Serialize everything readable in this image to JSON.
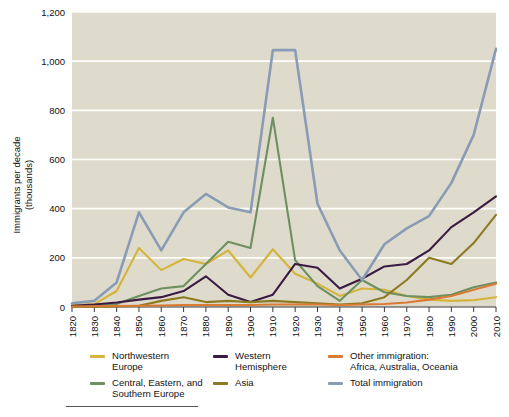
{
  "chart_data": {
    "type": "line",
    "title": "",
    "xlabel": "",
    "ylabel": "Immigrants per decade\n(thousands)",
    "ylabel_line1": "Immigrants per decade",
    "ylabel_line2": "(thousands)",
    "xlim": [
      1820,
      2010
    ],
    "ylim": [
      0,
      1200
    ],
    "yticks": [
      0,
      200,
      400,
      600,
      800,
      1000,
      1200
    ],
    "ytick_labels": [
      "0",
      "200",
      "400",
      "600",
      "800",
      "1,000",
      "1,200"
    ],
    "grid": "horizontal",
    "legend_position": "below",
    "plot_background": "#dedbcc",
    "x": [
      1820,
      1830,
      1840,
      1850,
      1860,
      1870,
      1880,
      1890,
      1900,
      1910,
      1920,
      1930,
      1940,
      1950,
      1960,
      1970,
      1980,
      1990,
      2000,
      2010
    ],
    "xtick_labels": [
      "1820",
      "1830",
      "1840",
      "1850",
      "1860",
      "1870",
      "1880",
      "1890",
      "1900",
      "1910",
      "1920",
      "1930",
      "1940",
      "1950",
      "1960",
      "1970",
      "1980",
      "1990",
      "2000",
      "2010"
    ],
    "series": [
      {
        "name": "Northwestern Europe",
        "color": "#d5b43c",
        "values": [
          8,
          12,
          65,
          240,
          150,
          195,
          175,
          230,
          120,
          235,
          135,
          95,
          45,
          75,
          70,
          45,
          30,
          25,
          28,
          40
        ]
      },
      {
        "name": "Central, Eastern, and Southern Europe",
        "color": "#6e9061",
        "values": [
          2,
          3,
          12,
          45,
          75,
          85,
          175,
          265,
          240,
          770,
          190,
          85,
          25,
          110,
          60,
          45,
          40,
          50,
          80,
          100
        ]
      },
      {
        "name": "Western Hemisphere",
        "color": "#3b1b42",
        "values": [
          5,
          10,
          18,
          30,
          40,
          65,
          125,
          50,
          20,
          50,
          175,
          160,
          75,
          115,
          165,
          175,
          230,
          325,
          385,
          450
        ]
      },
      {
        "name": "Asia",
        "color": "#8c7a22",
        "values": [
          1,
          1,
          2,
          5,
          25,
          40,
          20,
          25,
          20,
          25,
          20,
          15,
          10,
          15,
          40,
          110,
          200,
          175,
          260,
          375
        ]
      },
      {
        "name": "Other immigration: Africa, Australia, Oceania",
        "color": "#d97b34",
        "values": [
          2,
          3,
          4,
          5,
          6,
          8,
          8,
          8,
          8,
          10,
          10,
          10,
          8,
          10,
          12,
          18,
          30,
          45,
          70,
          95
        ]
      },
      {
        "name": "Total immigration",
        "color": "#8a9bb5",
        "values": [
          15,
          25,
          100,
          385,
          230,
          385,
          460,
          405,
          385,
          1045,
          1045,
          420,
          230,
          110,
          255,
          320,
          370,
          505,
          700,
          1050
        ]
      }
    ]
  },
  "legend": {
    "columns": [
      {
        "items": [
          {
            "label": "Northwestern\nEurope",
            "color": "#d5b43c",
            "name": "northwestern-europe"
          },
          {
            "label": "Central, Eastern, and\nSouthern Europe",
            "color": "#6e9061",
            "name": "central-eastern-southern-europe"
          }
        ]
      },
      {
        "items": [
          {
            "label": "Western\nHemisphere",
            "color": "#3b1b42",
            "name": "western-hemisphere"
          },
          {
            "label": "Asia",
            "color": "#8c7a22",
            "name": "asia"
          }
        ]
      },
      {
        "items": [
          {
            "label": "Other immigration:\nAfrica, Australia, Oceania",
            "color": "#d97b34",
            "name": "other-immigration"
          },
          {
            "label": "Total immigration",
            "color": "#8a9bb5",
            "name": "total-immigration"
          }
        ]
      }
    ]
  }
}
